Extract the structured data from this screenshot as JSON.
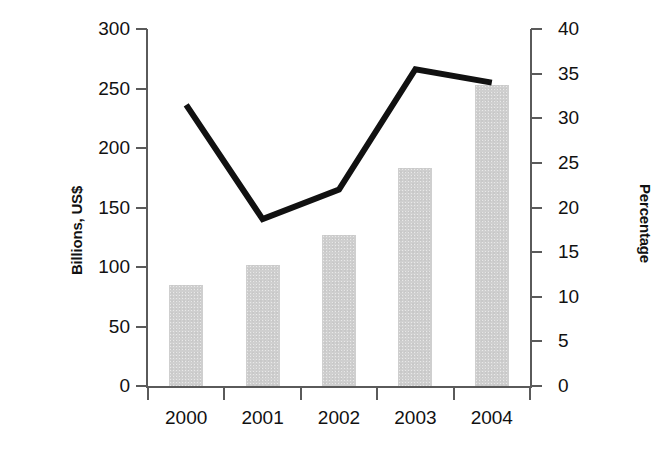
{
  "chart_data": {
    "type": "bar",
    "title": "",
    "subtitle": "",
    "xlabel": "",
    "categories": [
      "2000",
      "2001",
      "2002",
      "2003",
      "2004"
    ],
    "grid": false,
    "legend_position": "none",
    "annotations": [],
    "axes": {
      "left": {
        "label": "Billions, US$",
        "ylim": [
          0,
          300
        ],
        "tick_step": 50,
        "ticks": [
          300,
          250,
          200,
          150,
          100,
          50,
          0
        ],
        "tick_labels": [
          "300",
          "250",
          "200",
          "150",
          "100",
          "50",
          "0"
        ]
      },
      "right": {
        "label": "Percentage",
        "ylim": [
          0,
          40
        ],
        "tick_step": 5,
        "ticks": [
          40,
          35,
          30,
          25,
          20,
          15,
          10,
          5,
          0
        ],
        "tick_labels": [
          "40",
          "35",
          "30",
          "25",
          "20",
          "15",
          "10",
          "5",
          "0"
        ]
      }
    },
    "series": [
      {
        "name": "Billions, US$",
        "type": "bar",
        "axis": "left",
        "color": "#cfcfcf",
        "values": [
          85,
          102,
          127,
          183,
          253
        ]
      },
      {
        "name": "Percentage",
        "type": "line",
        "axis": "right",
        "color": "#111111",
        "values": [
          31.5,
          18.7,
          22.0,
          35.5,
          34.0
        ]
      }
    ]
  },
  "ylabel_left": "Billions, US$",
  "ylabel_right": "Percentage"
}
